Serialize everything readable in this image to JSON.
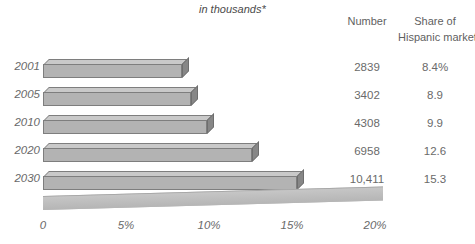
{
  "header": {
    "unit_note": "in thousands*",
    "number_label": "Number",
    "share_label_line1": "Share of",
    "share_label_line2": "Hispanic market"
  },
  "colors": {
    "bar_top": "#c9c9c9",
    "bar_front": "#b3b3b3",
    "bar_side": "#878787",
    "axis": "#bdbdbd",
    "text": "#6a6a6a",
    "background": "#ffffff"
  },
  "chart_data": {
    "type": "bar",
    "orientation": "horizontal",
    "title": "",
    "subtitle": "in thousands*",
    "xlabel": "",
    "ylabel": "",
    "categories": [
      "2001",
      "2005",
      "2010",
      "2020",
      "2030"
    ],
    "series": [
      {
        "name": "Share of Hispanic market",
        "unit": "%",
        "values": [
          8.4,
          8.9,
          9.9,
          12.6,
          15.3
        ]
      },
      {
        "name": "Number",
        "unit": "thousands",
        "values": [
          2839,
          3402,
          4308,
          6958,
          10411
        ]
      }
    ],
    "xlim": [
      0,
      20
    ],
    "xticks": [
      0,
      5,
      10,
      15,
      20
    ],
    "xtick_labels": [
      "0",
      "5%",
      "10%",
      "15%",
      "20%"
    ],
    "grid": false,
    "legend": "none",
    "style_3d": true
  },
  "rows": [
    {
      "year": "2001",
      "number": "2839",
      "share": "8.4%",
      "bar_value": 8.4
    },
    {
      "year": "2005",
      "number": "3402",
      "share": "8.9",
      "bar_value": 8.9
    },
    {
      "year": "2010",
      "number": "4308",
      "share": "9.9",
      "bar_value": 9.9
    },
    {
      "year": "2020",
      "number": "6958",
      "share": "12.6",
      "bar_value": 12.6
    },
    {
      "year": "2030",
      "number": "10,411",
      "share": "15.3",
      "bar_value": 15.3
    }
  ],
  "axis": {
    "ticks": [
      {
        "label": "0",
        "value": 0
      },
      {
        "label": "5%",
        "value": 5
      },
      {
        "label": "10%",
        "value": 10
      },
      {
        "label": "15%",
        "value": 15
      },
      {
        "label": "20%",
        "value": 20
      }
    ]
  }
}
